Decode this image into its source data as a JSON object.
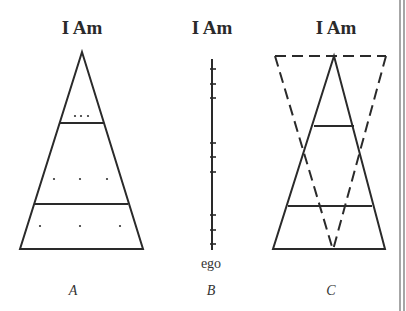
{
  "figure": {
    "panels": [
      {
        "id": "A",
        "title": "I Am",
        "caption": "A",
        "description": "Triangle divided by two horizontal lines into three tiers with dots"
      },
      {
        "id": "B",
        "title": "I Am",
        "caption": "B",
        "bottom_label": "ego",
        "description": "Vertical line with three groups of three tick marks"
      },
      {
        "id": "C",
        "title": "I Am",
        "caption": "C",
        "description": "Solid triangle overlaid with dashed inverted triangle"
      }
    ],
    "colors": {
      "ink": "#2a2a2a",
      "background": "#ffffff",
      "border": "#777777"
    }
  }
}
